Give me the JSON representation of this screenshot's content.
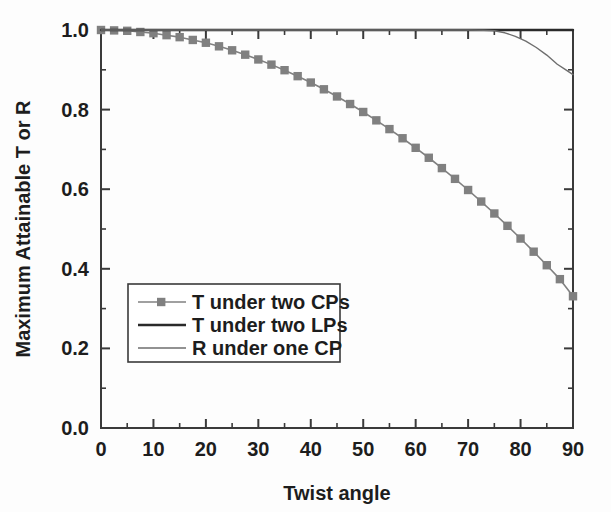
{
  "chart_data": {
    "type": "line",
    "title": "",
    "xlabel": "Twist angle",
    "ylabel": "Maximum Attainable T or R",
    "xlim": [
      0,
      90
    ],
    "ylim": [
      0.0,
      1.0
    ],
    "xticks": [
      0,
      10,
      20,
      30,
      40,
      50,
      60,
      70,
      80,
      90
    ],
    "xtick_labels": [
      "0",
      "10",
      "20",
      "30",
      "40",
      "50",
      "60",
      "70",
      "80",
      "90"
    ],
    "xminor_step": 5,
    "yticks": [
      0.0,
      0.2,
      0.4,
      0.6,
      0.8,
      1.0
    ],
    "ytick_labels": [
      "0.0",
      "0.2",
      "0.4",
      "0.6",
      "0.8",
      "1.0"
    ],
    "yminor_step": 0.1,
    "grid": false,
    "legend_position": "center-left-lower",
    "series": [
      {
        "name": "T under two CPs",
        "color": "#808080",
        "marker": "square",
        "line_width": 1.6,
        "x": [
          0,
          2.5,
          5,
          7.5,
          10,
          12.5,
          15,
          17.5,
          20,
          22.5,
          25,
          27.5,
          30,
          32.5,
          35,
          37.5,
          40,
          42.5,
          45,
          47.5,
          50,
          52.5,
          55,
          57.5,
          60,
          62.5,
          65,
          67.5,
          70,
          72.5,
          75,
          77.5,
          80,
          82.5,
          85,
          87.5,
          90
        ],
        "values": [
          1.0,
          0.999,
          0.998,
          0.995,
          0.992,
          0.987,
          0.982,
          0.975,
          0.968,
          0.959,
          0.949,
          0.938,
          0.926,
          0.913,
          0.899,
          0.884,
          0.868,
          0.851,
          0.833,
          0.814,
          0.794,
          0.773,
          0.751,
          0.728,
          0.704,
          0.679,
          0.653,
          0.626,
          0.598,
          0.569,
          0.539,
          0.508,
          0.476,
          0.443,
          0.409,
          0.374,
          0.331
        ]
      },
      {
        "name": "T under two LPs",
        "color": "#2a2a2a",
        "marker": "none",
        "line_width": 2.4,
        "x": [
          0,
          90
        ],
        "values": [
          1.0,
          1.0
        ]
      },
      {
        "name": "R under one CP",
        "color": "#6e6e6e",
        "marker": "none",
        "line_width": 1.4,
        "x": [
          0,
          10,
          20,
          30,
          40,
          50,
          60,
          65,
          70,
          73,
          75,
          77,
          79,
          81,
          83,
          85,
          87,
          88.5,
          90
        ],
        "values": [
          1.0,
          1.0,
          1.0,
          1.0,
          1.0,
          1.0,
          1.0,
          1.0,
          1.0,
          0.9995,
          0.998,
          0.993,
          0.984,
          0.972,
          0.956,
          0.937,
          0.914,
          0.901,
          0.888
        ]
      }
    ]
  },
  "legend": {
    "entries": [
      {
        "label": "T under two CPs",
        "style": "line-with-square-marker",
        "color": "#808080"
      },
      {
        "label": "T under two LPs",
        "style": "thick-line",
        "color": "#2a2a2a"
      },
      {
        "label": "R under one CP",
        "style": "thin-line",
        "color": "#6e6e6e"
      }
    ]
  },
  "colors": {
    "axis": "#3a3a3a",
    "text": "#1d1d1d",
    "background": "#fdfdfd",
    "series_cp": "#808080",
    "series_lp": "#2a2a2a",
    "series_r": "#6e6e6e"
  }
}
